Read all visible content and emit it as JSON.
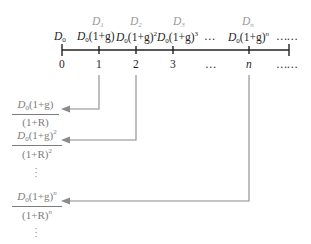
{
  "timeline": {
    "ticks": [
      {
        "label": "0",
        "x": 62
      },
      {
        "label": "1",
        "x": 99
      },
      {
        "label": "2",
        "x": 136
      },
      {
        "label": "3",
        "x": 173
      },
      {
        "label": "…",
        "x": 211
      },
      {
        "label": "n",
        "x": 249
      },
      {
        "label": "……",
        "x": 280
      }
    ],
    "dividend_names": {
      "d1": "D",
      "d1_sub": "1",
      "d2": "D",
      "d2_sub": "2",
      "d3": "D",
      "d3_sub": "3",
      "dn": "D",
      "dn_sub": "n"
    },
    "cash_flows": {
      "d0": "D",
      "d0_sub": "0",
      "cf1_base": "D",
      "cf1_sub": "0",
      "cf1_rest": "(1+g)",
      "cf2_base": "D",
      "cf2_sub": "0",
      "cf2_rest": "(1+g)",
      "cf2_exp": "2",
      "cf3_base": "D",
      "cf3_sub": "0",
      "cf3_rest": "(1+g)",
      "cf3_exp": "3",
      "ellipsis_mid": "…",
      "cfn_base": "D",
      "cfn_sub": "0",
      "cfn_rest": "(1+g)",
      "cfn_exp": "n",
      "ellipsis_end": "……"
    }
  },
  "present_values": [
    {
      "num_base": "D",
      "num_sub": "0",
      "num_rest": "(1+g)",
      "num_exp": "",
      "den_rest": "(1+R)",
      "den_exp": ""
    },
    {
      "num_base": "D",
      "num_sub": "0",
      "num_rest": "(1+g)",
      "num_exp": "2",
      "den_rest": "(1+R)",
      "den_exp": "2"
    },
    {
      "num_base": "D",
      "num_sub": "0",
      "num_rest": "(1+g)",
      "num_exp": "n",
      "den_rest": "(1+R)",
      "den_exp": "n"
    }
  ],
  "vertical_ellipsis": "⋮",
  "colors": {
    "axis": "#222222",
    "arrow": "#8a8a8a",
    "label_grey": "#9a9a9a",
    "fraction_text": "#7c7c7c"
  }
}
